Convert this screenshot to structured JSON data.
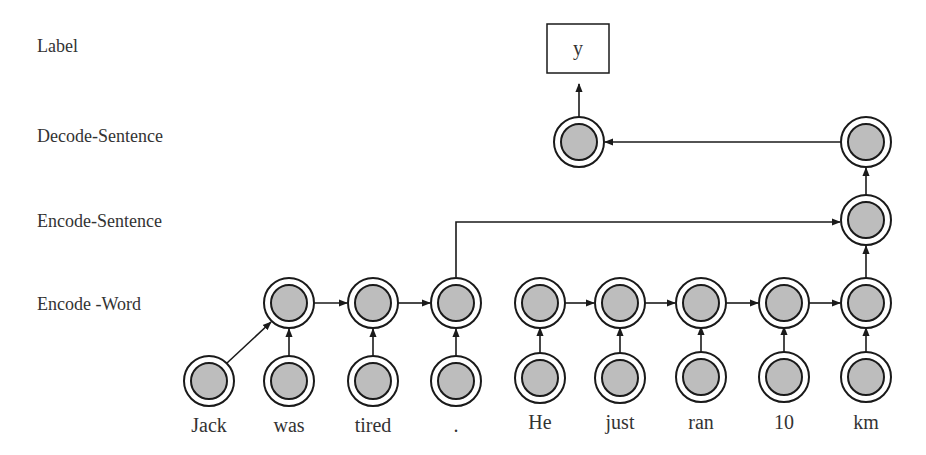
{
  "row_labels": {
    "label": "Label",
    "decode_sentence": "Decode-Sentence",
    "encode_sentence": "Encode-Sentence",
    "encode_word": "Encode -Word"
  },
  "output": {
    "text": "y"
  },
  "words": [
    "Jack",
    "was",
    "tired",
    ".",
    "He",
    "just",
    "ran",
    "10",
    "km"
  ],
  "colors": {
    "node_fill": "#bdbdbd",
    "stroke": "#1a1a1a",
    "text": "#333333"
  }
}
